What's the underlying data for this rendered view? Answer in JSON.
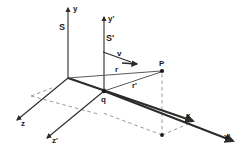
{
  "figure": {
    "type": "physics-vector-diagram",
    "background_color": "#ffffff",
    "line_color": "#2b2b2b",
    "dashed_color": "#9a9a9a",
    "thin_color": "#707070"
  },
  "frames": [
    {
      "id": "S",
      "label": "S",
      "label_pos": {
        "x": 61,
        "y": 27
      },
      "origin": {
        "x": 68,
        "y": 78
      },
      "axes": [
        {
          "name": "y",
          "label": "y",
          "label_pos": {
            "x": 73,
            "y": 11
          },
          "tip": {
            "x": 68,
            "y": 5
          }
        },
        {
          "name": "x",
          "label": "x",
          "label_pos": {
            "x": 189,
            "y": 118
          },
          "tip": {
            "x": 196,
            "y": 123
          }
        },
        {
          "name": "z",
          "label": "z",
          "label_pos": {
            "x": 23,
            "y": 124
          },
          "tip": {
            "x": 14,
            "y": 118
          }
        }
      ]
    },
    {
      "id": "S'",
      "label": "S'",
      "label_pos": {
        "x": 107,
        "y": 37
      },
      "origin": {
        "x": 104,
        "y": 91
      },
      "axes": [
        {
          "name": "y'",
          "label": "y'",
          "label_pos": {
            "x": 108,
            "y": 19
          },
          "tip": {
            "x": 104,
            "y": 14
          }
        },
        {
          "name": "x'",
          "label": "x'",
          "label_pos": {
            "x": 226,
            "y": 138
          },
          "tip": {
            "x": 236,
            "y": 143
          }
        },
        {
          "name": "z'",
          "label": "z'",
          "label_pos": {
            "x": 54,
            "y": 142
          },
          "tip": {
            "x": 44,
            "y": 136
          }
        }
      ]
    }
  ],
  "velocity": {
    "label": "v",
    "label_pos": {
      "x": 118,
      "y": 56
    },
    "from": {
      "x": 104,
      "y": 53
    },
    "to": {
      "x": 134,
      "y": 63
    }
  },
  "points": [
    {
      "id": "P",
      "label": "P",
      "pos": {
        "x": 162,
        "y": 71
      },
      "label_pos": {
        "x": 161,
        "y": 63
      }
    },
    {
      "id": "q",
      "label": "q",
      "pos": {
        "x": 104,
        "y": 91
      },
      "label_pos": {
        "x": 103,
        "y": 101
      }
    },
    {
      "id": "P-projection",
      "label": "",
      "pos": {
        "x": 162,
        "y": 135
      },
      "label_pos": {
        "x": 162,
        "y": 135
      }
    }
  ],
  "vectors": [
    {
      "id": "r",
      "label": "r",
      "label_pos": {
        "x": 117,
        "y": 70
      },
      "from": {
        "x": 68,
        "y": 78
      },
      "to": {
        "x": 162,
        "y": 71
      },
      "note": "position vector from origin of S to P"
    },
    {
      "id": "r-prime",
      "label": "r'",
      "label_pos": {
        "x": 134,
        "y": 86
      },
      "from": {
        "x": 104,
        "y": 91
      },
      "to": {
        "x": 162,
        "y": 71
      },
      "note": "position vector from charge q to P"
    }
  ],
  "labels": {
    "frame_S": "S",
    "frame_S_prime": "S'",
    "axis_y": "y",
    "axis_y_prime": "y'",
    "axis_x": "x",
    "axis_x_prime": "x'",
    "axis_z": "z",
    "axis_z_prime": "z'",
    "velocity": "v",
    "point_P": "P",
    "charge_q": "q",
    "vector_r": "r",
    "vector_r_prime": "r'"
  }
}
